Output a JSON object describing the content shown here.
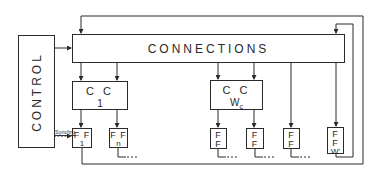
{
  "diagram": {
    "control": {
      "label": "CONTROL"
    },
    "connections": {
      "label": "CONNECTIONS"
    },
    "cc_blocks": [
      {
        "label": "C C",
        "sub": "1"
      },
      {
        "label": "C C",
        "sub": "W",
        "sub_index": "c"
      }
    ],
    "ff_blocks": [
      {
        "label": "F F",
        "sub": "1"
      },
      {
        "label": "F F",
        "sub": "n"
      },
      {
        "label": "F F",
        "sub": ""
      },
      {
        "label": "F F",
        "sub": ""
      },
      {
        "label": "F F",
        "sub": ""
      },
      {
        "label": "F F",
        "sub": "W'"
      }
    ],
    "synchro_label": "Synchro",
    "continuation": "----",
    "line_color": "#2a2a2a"
  }
}
